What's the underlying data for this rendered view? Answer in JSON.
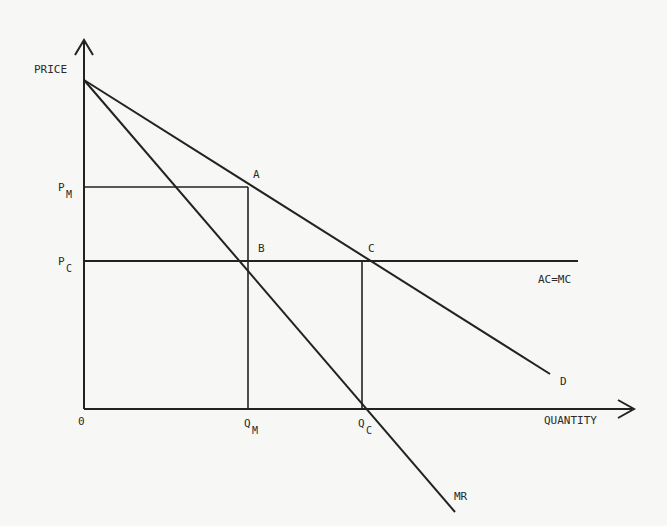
{
  "diagram": {
    "axes": {
      "y_label": "PRICE",
      "x_label": "QUANTITY",
      "origin_label": "0"
    },
    "price_labels": {
      "pm_main": "P",
      "pm_sub": "M",
      "pc_main": "P",
      "pc_sub": "C"
    },
    "quantity_labels": {
      "qm_main": "Q",
      "qm_sub": "M",
      "qc_main": "Q",
      "qc_sub": "C"
    },
    "points": {
      "a": "A",
      "b": "B",
      "c": "C"
    },
    "curves": {
      "demand": "D",
      "marginal_revenue": "MR",
      "cost": "AC=MC"
    },
    "colors": {
      "line": "#222222",
      "background": "#f7f7f5"
    }
  }
}
